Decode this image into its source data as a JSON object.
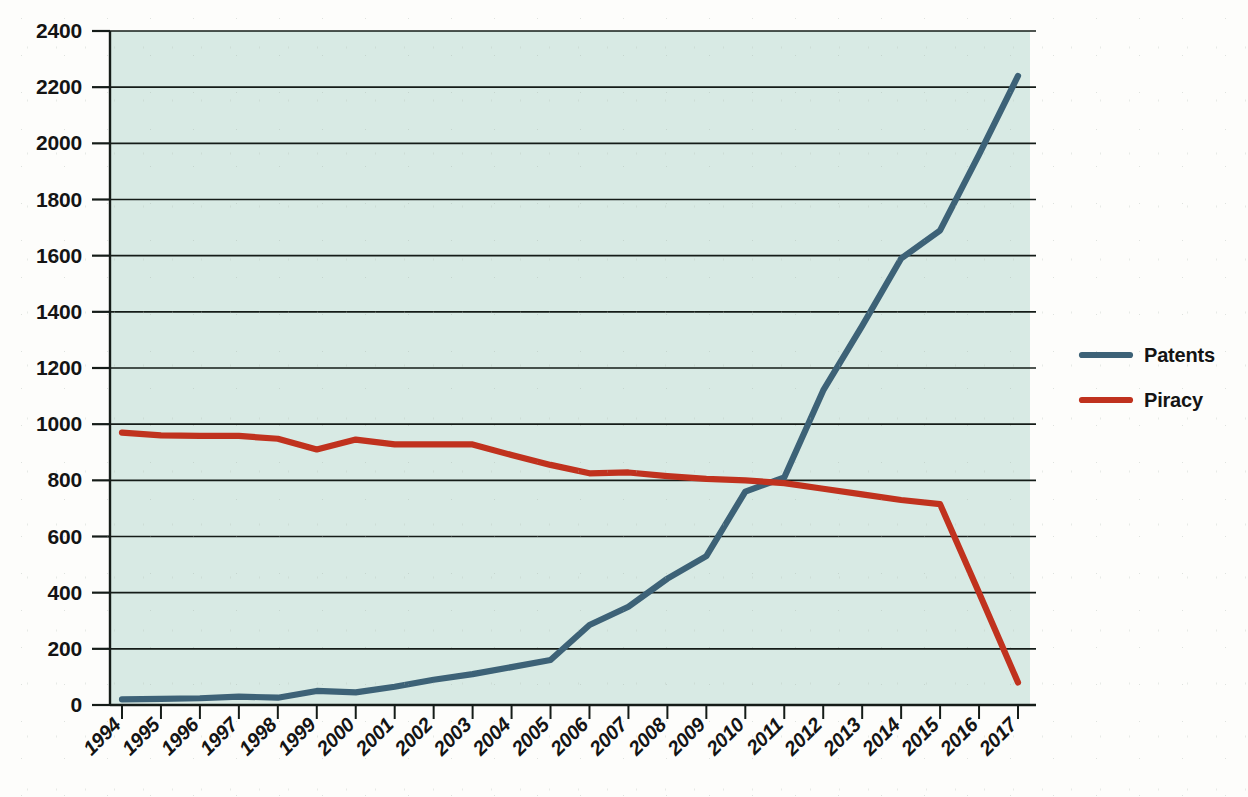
{
  "chart_data": {
    "type": "line",
    "title": "",
    "subtitle": "",
    "xlabel": "",
    "ylabel": "",
    "x": [
      1994,
      1995,
      1996,
      1997,
      1998,
      1999,
      2000,
      2001,
      2002,
      2003,
      2004,
      2005,
      2006,
      2007,
      2008,
      2009,
      2010,
      2011,
      2012,
      2013,
      2014,
      2015,
      2016,
      2017
    ],
    "categories": [
      "1994",
      "1995",
      "1996",
      "1997",
      "1998",
      "1999",
      "2000",
      "2001",
      "2002",
      "2003",
      "2004",
      "2005",
      "2006",
      "2007",
      "2008",
      "2009",
      "2010",
      "2011",
      "2012",
      "2013",
      "2014",
      "2015",
      "2016",
      "2017"
    ],
    "series": [
      {
        "name": "Patents",
        "color": "#3d6277",
        "values": [
          20,
          22,
          24,
          30,
          26,
          50,
          45,
          65,
          90,
          110,
          135,
          160,
          285,
          350,
          450,
          530,
          760,
          810,
          1120,
          1350,
          1590,
          1690,
          1960,
          2240
        ]
      },
      {
        "name": "Piracy",
        "color": "#c0321e",
        "values": [
          970,
          960,
          958,
          958,
          948,
          910,
          945,
          928,
          928,
          928,
          890,
          855,
          825,
          828,
          815,
          805,
          800,
          790,
          770,
          750,
          730,
          715,
          400,
          80
        ]
      }
    ],
    "yticks": [
      0,
      200,
      400,
      600,
      800,
      1000,
      1200,
      1400,
      1600,
      1800,
      2000,
      2200,
      2400
    ],
    "ylim": [
      0,
      2400
    ],
    "xlim": [
      1994,
      2017
    ],
    "grid": true,
    "grid_orientation": "horizontal",
    "legend_position": "right",
    "plot_background": "#d8eae4",
    "page_background": "#fdfdfb",
    "axis_color": "#151c18",
    "xtick_label_rotation": -45
  },
  "legend": {
    "entries": [
      {
        "label": "Patents",
        "color": "#3d6277"
      },
      {
        "label": "Piracy",
        "color": "#c0321e"
      }
    ]
  }
}
